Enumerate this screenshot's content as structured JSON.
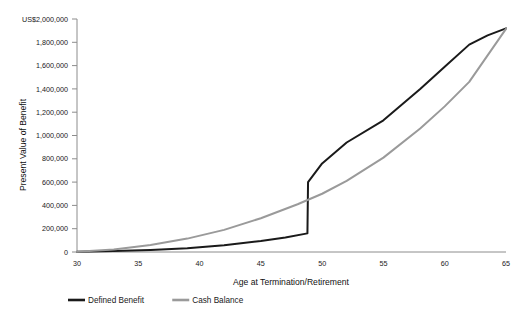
{
  "chart_data": {
    "type": "line",
    "title": "",
    "xlabel": "Age at Termination/Retirement",
    "ylabel": "Present Value of Benefit",
    "xlim": [
      30,
      65
    ],
    "ylim": [
      0,
      2000000
    ],
    "grid": false,
    "legend_position": "bottom-left",
    "x_ticks": [
      30,
      35,
      40,
      45,
      50,
      55,
      60,
      65
    ],
    "x_tick_labels": [
      "30",
      "35",
      "40",
      "45",
      "50",
      "55",
      "60",
      "65"
    ],
    "y_ticks": [
      0,
      200000,
      400000,
      600000,
      800000,
      1000000,
      1200000,
      1400000,
      1600000,
      1800000,
      2000000
    ],
    "y_tick_labels": [
      "0",
      "200,000",
      "400,000",
      "600,000",
      "800,000",
      "1,000,000",
      "1,200,000",
      "1,400,000",
      "1,600,000",
      "1,800,000",
      "US$2,000,000"
    ],
    "series": [
      {
        "name": "Defined Benefit",
        "color": "#1a1a1a",
        "width": 2.0,
        "x": [
          30,
          33,
          36,
          39,
          42,
          45,
          47,
          48.8,
          48.85,
          50,
          52,
          55,
          58,
          60,
          62,
          63.5,
          65
        ],
        "values": [
          3000,
          9000,
          18000,
          33000,
          58000,
          95000,
          125000,
          160000,
          600000,
          760000,
          940000,
          1130000,
          1400000,
          1590000,
          1780000,
          1860000,
          1920000
        ]
      },
      {
        "name": "Cash Balance",
        "color": "#9a9a9a",
        "width": 2.0,
        "x": [
          30,
          33,
          36,
          39,
          42,
          45,
          48,
          50,
          52,
          55,
          58,
          60,
          62,
          65
        ],
        "values": [
          2000,
          22000,
          60000,
          115000,
          190000,
          290000,
          410000,
          500000,
          610000,
          810000,
          1060000,
          1250000,
          1460000,
          1915000
        ]
      }
    ]
  },
  "axes": {
    "y_axis_top_label": "US$2,000,000",
    "x_axis_title": "Age at Termination/Retirement",
    "y_axis_title": "Present Value of Benefit"
  },
  "legend": {
    "items": [
      {
        "label": "Defined Benefit",
        "color": "#1a1a1a"
      },
      {
        "label": "Cash Balance",
        "color": "#9a9a9a"
      }
    ]
  },
  "cropped_header": {
    "text": ""
  }
}
